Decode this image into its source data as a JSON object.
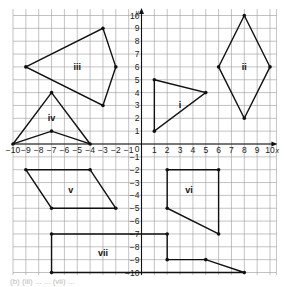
{
  "chart_data": {
    "type": "coordinate-grid",
    "xlabel": "x",
    "ylabel": "y",
    "xlim": [
      -10,
      10
    ],
    "ylim": [
      -10,
      10
    ],
    "grid": true,
    "x_ticks": [
      -10,
      -9,
      -8,
      -7,
      -6,
      -5,
      -4,
      -3,
      -2,
      -1,
      1,
      2,
      3,
      4,
      5,
      6,
      7,
      8,
      9,
      10
    ],
    "y_ticks": [
      -10,
      -9,
      -8,
      -7,
      -6,
      -5,
      -4,
      -3,
      -2,
      -1,
      1,
      2,
      3,
      4,
      5,
      6,
      7,
      8,
      9,
      10
    ],
    "origin_label": "0",
    "shapes": [
      {
        "name": "i",
        "label_pos": [
          3,
          3
        ],
        "vertices": [
          [
            1,
            5
          ],
          [
            5,
            4
          ],
          [
            1,
            1
          ]
        ]
      },
      {
        "name": "ii",
        "label_pos": [
          8,
          6
        ],
        "vertices": [
          [
            8,
            10
          ],
          [
            10,
            6
          ],
          [
            8,
            2
          ],
          [
            6,
            6
          ]
        ]
      },
      {
        "name": "iii",
        "label_pos": [
          -5,
          6
        ],
        "vertices": [
          [
            -9,
            6
          ],
          [
            -3,
            9
          ],
          [
            -2,
            6
          ],
          [
            -3,
            3
          ]
        ]
      },
      {
        "name": "iv",
        "label_pos": [
          -7,
          2
        ],
        "vertices": [
          [
            -10,
            0
          ],
          [
            -7,
            4
          ],
          [
            -4,
            0
          ],
          [
            -7,
            1
          ]
        ]
      },
      {
        "name": "v",
        "label_pos": [
          -5.5,
          -3.6
        ],
        "vertices": [
          [
            -9,
            -2
          ],
          [
            -4,
            -2
          ],
          [
            -2,
            -5
          ],
          [
            -7,
            -5
          ]
        ]
      },
      {
        "name": "vi",
        "label_pos": [
          3.7,
          -3.6
        ],
        "vertices": [
          [
            2,
            -2
          ],
          [
            6,
            -2
          ],
          [
            6,
            -7
          ],
          [
            2,
            -5
          ]
        ]
      },
      {
        "name": "vii",
        "label_pos": [
          -3,
          -8.5
        ],
        "vertices": [
          [
            -7,
            -7
          ],
          [
            2,
            -7
          ],
          [
            2,
            -9
          ],
          [
            5,
            -9
          ],
          [
            8,
            -10
          ],
          [
            -7,
            -10
          ]
        ]
      }
    ]
  },
  "layout": {
    "origin_px": [
      141.5,
      144
    ],
    "unit_px": 12.85,
    "grid_extent": {
      "xmin": -10,
      "xmax": 10.5,
      "ymin": -10.2,
      "ymax": 10.5
    }
  },
  "caption": "(b) (iii) ... ... (vii) ..."
}
